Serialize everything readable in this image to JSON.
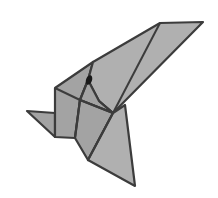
{
  "image": {
    "subject": "origami bird illustration",
    "width": 218,
    "height": 198,
    "colors": {
      "background": "#ffffff",
      "fill": "#a3a3a3",
      "fill_light": "#b0b0b0",
      "edge": "#3c3c3c",
      "eye": "#1a1a1a"
    }
  },
  "shapes": {
    "tail": "27,111 55,113 55,137",
    "head_block": "55,88 93,62 88,80 80,100 75,138 55,137",
    "wing": "93,62 160,23 203,22 113,113 99,101 88,80",
    "neck": "88,80 99,101 113,113 80,100",
    "chest": "80,100 113,113 88,160 75,138",
    "belly": "113,113 125,105 135,186 88,160"
  },
  "fold_lines": [
    "160,23 113,113",
    "55,88 80,100",
    "80,100 113,113",
    "88,80 80,100",
    "80,100 75,138",
    "113,113 88,160",
    "99,101 113,113"
  ],
  "eye": {
    "cx": 89,
    "cy": 80,
    "rx": 3,
    "ry": 5
  }
}
